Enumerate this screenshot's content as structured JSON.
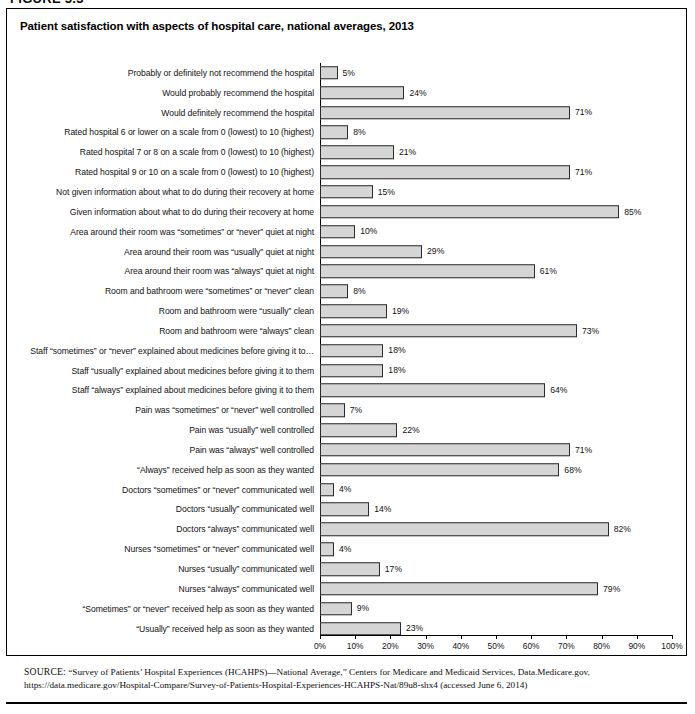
{
  "figure": {
    "number_label": "FIGURE 5.3"
  },
  "chart_title": "Patient satisfaction with aspects of hospital care, national averages, 2013",
  "source": {
    "label": "SOURCE:",
    "text": " “Survey of Patients’ Hospital Experiences (HCAHPS)—National Average,” Centers for Medicare and Medicaid Services, Data.Medicare.gov, https://data.medicare.gov/Hospital-Compare/Survey-of-Patients-Hospital-Experiences-HCAHPS-Nat/89u8-shx4 (accessed June 6, 2014)"
  },
  "axis": {
    "tick_labels": [
      "0%",
      "10%",
      "20%",
      "30%",
      "40%",
      "50%",
      "60%",
      "70%",
      "80%",
      "90%",
      "100%"
    ]
  },
  "colors": {
    "bar_fill": "#d5d5d5",
    "bar_border": "#2b2b2b",
    "frame": "#000000"
  },
  "chart_data": {
    "type": "bar",
    "orientation": "horizontal",
    "title": "Patient satisfaction with aspects of hospital care, national averages, 2013",
    "xlabel": "",
    "ylabel": "",
    "xlim": [
      0,
      100
    ],
    "unit": "percent",
    "grid": false,
    "legend": "none",
    "xticks": [
      0,
      10,
      20,
      30,
      40,
      50,
      60,
      70,
      80,
      90,
      100
    ],
    "categories": [
      "Probably or definitely not recommend the hospital",
      "Would probably recommend the hospital",
      "Would definitely recommend the hospital",
      "Rated hospital 6 or lower on a scale from 0 (lowest) to 10 (highest)",
      "Rated hospital 7 or 8 on a scale from 0 (lowest) to 10 (highest)",
      "Rated hospital 9 or 10 on a scale from 0 (lowest) to 10 (highest)",
      "Not given information about what to do during their recovery at home",
      "Given information about what to do during their recovery at home",
      "Area around their room was “sometimes” or “never” quiet at night",
      "Area around their room was “usually” quiet at night",
      "Area around their room was “always” quiet at night",
      "Room and bathroom were “sometimes” or “never” clean",
      "Room and bathroom were “usually” clean",
      "Room and bathroom were “always” clean",
      "Staff “sometimes” or “never” explained about medicines before giving it to…",
      "Staff “usually” explained about medicines before giving it to them",
      "Staff “always” explained about medicines before giving it to them",
      "Pain was “sometimes” or “never” well controlled",
      "Pain was “usually” well controlled",
      "Pain was “always” well controlled",
      "“Always” received help as soon as they wanted",
      "Doctors “sometimes” or “never” communicated well",
      "Doctors “usually” communicated well",
      "Doctors “always” communicated well",
      "Nurses “sometimes” or “never” communicated well",
      "Nurses “usually” communicated well",
      "Nurses “always” communicated well",
      "“Sometimes” or “never” received help as soon as they wanted",
      "“Usually” received help as soon as they wanted"
    ],
    "values": [
      5,
      24,
      71,
      8,
      21,
      71,
      15,
      85,
      10,
      29,
      61,
      8,
      19,
      73,
      18,
      18,
      64,
      7,
      22,
      71,
      68,
      4,
      14,
      82,
      4,
      17,
      79,
      9,
      23
    ],
    "value_labels": [
      "5%",
      "24%",
      "71%",
      "8%",
      "21%",
      "71%",
      "15%",
      "85%",
      "10%",
      "29%",
      "61%",
      "8%",
      "19%",
      "73%",
      "18%",
      "18%",
      "64%",
      "7%",
      "22%",
      "71%",
      "68%",
      "4%",
      "14%",
      "82%",
      "4%",
      "17%",
      "79%",
      "9%",
      "23%"
    ]
  }
}
